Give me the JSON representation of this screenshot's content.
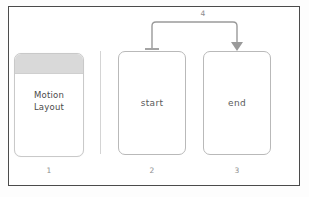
{
  "editor": {
    "background_color": "#ffffff",
    "border_color": "#4b4b4b"
  },
  "panel": {
    "card": {
      "title": "Motion\nLayout",
      "index_label": "1",
      "header_color": "#d9d9d9",
      "border_color": "#c9c9c9"
    },
    "divider_color": "#d4d4d4"
  },
  "components": [
    {
      "name": "start",
      "label": "start",
      "index_label": "2",
      "border_color": "#b9b9b9",
      "fill_color": "#ffffff"
    },
    {
      "name": "end",
      "label": "end",
      "index_label": "3",
      "border_color": "#b9b9b9",
      "fill_color": "#ffffff"
    }
  ],
  "transition": {
    "index_label": "4",
    "from": "start",
    "to": "end",
    "stroke_color": "#9a9a9a",
    "source_terminator": "t-bar",
    "target_terminator": "filled-arrowhead"
  }
}
